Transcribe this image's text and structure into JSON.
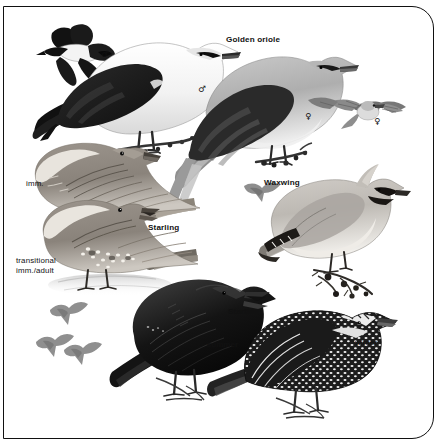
{
  "plate": {
    "title": "Bird identification plate",
    "background_color": "#ffffff",
    "frame_color": "#111111",
    "palette": {
      "ink": "#111111",
      "dark_gray": "#3a3a3a",
      "mid_gray": "#7d7d7d",
      "light_gray": "#b8b8b8",
      "pale": "#e2e2e2",
      "silhouette_gray": "#8e8e8e"
    }
  },
  "labels": {
    "golden_oriole": "Golden oriole",
    "waxwing": "Waxwing",
    "starling_mid": "Starling",
    "starling_bottom": "Starling",
    "imm": "imm.",
    "transitional_line1": "transitional",
    "transitional_line2": "imm./adult",
    "winter": "winter",
    "summer": "summer",
    "male_symbol": "♂",
    "female_symbol": "♀"
  },
  "figures": [
    {
      "id": "oriole-male-flight",
      "species": "Golden oriole",
      "pose": "flight",
      "sex": "♂",
      "position": "top-left"
    },
    {
      "id": "oriole-male-perched",
      "species": "Golden oriole",
      "pose": "perched",
      "sex": "♂",
      "position": "top-center-left"
    },
    {
      "id": "oriole-female-perched",
      "species": "Golden oriole",
      "pose": "perched",
      "sex": "♀",
      "position": "top-center-right"
    },
    {
      "id": "oriole-female-flight",
      "species": "Golden oriole",
      "pose": "flight",
      "sex": "♀",
      "position": "top-right"
    },
    {
      "id": "starling-imm",
      "species": "Starling",
      "plumage": "imm.",
      "pose": "perched",
      "position": "mid-left-upper"
    },
    {
      "id": "starling-transitional",
      "species": "Starling",
      "plumage": "transitional imm./adult",
      "pose": "standing",
      "position": "mid-left-lower"
    },
    {
      "id": "waxwing-flight",
      "species": "Waxwing",
      "pose": "flight-silhouette",
      "position": "mid-right-left"
    },
    {
      "id": "waxwing-perched",
      "species": "Waxwing",
      "pose": "perched-on-berry-branch",
      "position": "mid-right"
    },
    {
      "id": "starling-summer-male",
      "species": "Starling",
      "plumage": "♂ summer",
      "pose": "singing",
      "position": "bottom-center"
    },
    {
      "id": "starling-winter",
      "species": "Starling",
      "plumage": "winter",
      "pose": "perched",
      "position": "bottom-right"
    },
    {
      "id": "starling-flight-silhouettes",
      "species": "Starling",
      "pose": "flight-silhouettes",
      "count": 3,
      "position": "bottom-left"
    }
  ]
}
